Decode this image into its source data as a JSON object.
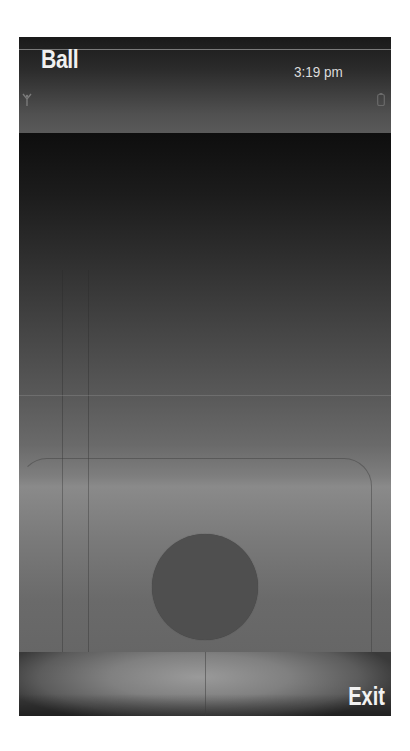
{
  "header": {
    "app_title": "Ball",
    "clock": "3:19 pm",
    "icons": {
      "signal": "signal-antenna-icon",
      "battery": "battery-icon"
    }
  },
  "canvas": {
    "ball": {
      "color": "#4f4f4f",
      "center_x": 205,
      "center_y": 491,
      "radius": 53
    },
    "background_gradient": [
      "#0e0e0e",
      "#8a8a8a",
      "#666666"
    ]
  },
  "softkeys": {
    "left_label": "",
    "right_label": "Exit"
  },
  "colors": {
    "title_text": "#f0f0f0",
    "clock_text": "#dcdcdc",
    "page_background": "#ffffff"
  }
}
